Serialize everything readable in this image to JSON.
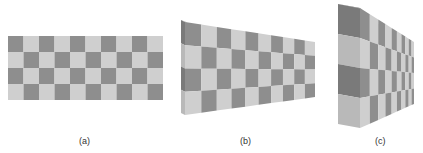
{
  "figure": {
    "colors": {
      "dark": "#8e8e8e",
      "light": "#cfcfcf",
      "side_dark": "#7a7a7a",
      "side_light": "#b9b9b9",
      "top": "#a8a8a8"
    },
    "panels": [
      {
        "id": "a",
        "label": "(a)",
        "label_pos": [
          79,
          136
        ],
        "cols": 10,
        "rows": 4,
        "front": {
          "tl": [
            8,
            36
          ],
          "tr": [
            163,
            36
          ],
          "br": [
            163,
            100
          ],
          "bl": [
            8,
            100
          ]
        },
        "first_dark": true
      },
      {
        "id": "b",
        "label": "(b)",
        "label_pos": [
          240,
          136
        ],
        "cols": 10,
        "rows": 4,
        "front": {
          "tl": [
            185,
            22
          ],
          "tr": [
            315,
            42
          ],
          "br": [
            315,
            97
          ],
          "bl": [
            185,
            115
          ]
        },
        "side": {
          "tl": [
            181,
            20
          ],
          "bl": [
            181,
            113
          ]
        },
        "persp": 0.62,
        "first_dark": true
      },
      {
        "id": "c",
        "label": "(c)",
        "label_pos": [
          375,
          136
        ],
        "cols": 10,
        "rows": 4,
        "front": {
          "tl": [
            360,
            8
          ],
          "tr": [
            414,
            42
          ],
          "br": [
            414,
            104
          ],
          "bl": [
            360,
            128
          ]
        },
        "side": {
          "tl": [
            338,
            4
          ],
          "bl": [
            338,
            124
          ]
        },
        "persp": 0.25,
        "first_dark": true
      }
    ]
  }
}
